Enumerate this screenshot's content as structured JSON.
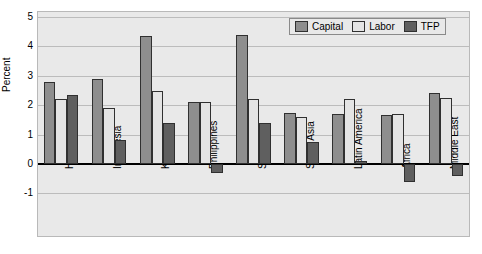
{
  "chart_data": {
    "type": "bar",
    "title": "",
    "subtitle": "",
    "xlabel": "",
    "ylabel": "Percent",
    "ylim": [
      -1,
      5
    ],
    "yticks": [
      5,
      4,
      3,
      2,
      1,
      0,
      -1
    ],
    "ytick_labels": [
      "5",
      "4",
      "3",
      "2",
      "1",
      "0",
      "-1"
    ],
    "grid": true,
    "legend_position": "top-right",
    "categories": [
      "Hong Kong",
      "Indonesia",
      "Korea",
      "Philippines",
      "Singapore",
      "South Asia",
      "Latin America",
      "Africa",
      "Middle East"
    ],
    "series": [
      {
        "name": "Capital",
        "color": "#8e8e8e",
        "values": [
          2.8,
          2.9,
          4.35,
          2.1,
          4.4,
          1.75,
          1.7,
          1.65,
          2.4
        ]
      },
      {
        "name": "Labor",
        "color": "#e4e4e4",
        "values": [
          2.2,
          1.9,
          2.5,
          2.1,
          2.2,
          1.6,
          2.2,
          1.7,
          2.25
        ]
      },
      {
        "name": "TFP",
        "color": "#5f5f5f",
        "values": [
          2.35,
          0.8,
          1.4,
          -0.3,
          1.4,
          0.75,
          0.1,
          -0.6,
          -0.4
        ]
      }
    ]
  },
  "legend": {
    "items": [
      {
        "label": "Capital",
        "swatch": "capital"
      },
      {
        "label": "Labor",
        "swatch": "labor"
      },
      {
        "label": "TFP",
        "swatch": "tfp"
      }
    ]
  }
}
